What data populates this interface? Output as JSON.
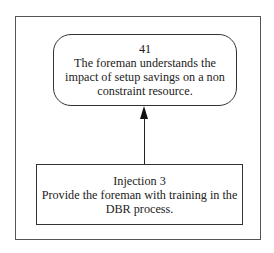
{
  "diagram": {
    "effect_node": {
      "id": "41",
      "lines": [
        "The foreman understands the",
        "impact of setup savings on a non",
        "constraint resource."
      ]
    },
    "injection_node": {
      "label": "Injection 3",
      "lines": [
        "Provide the foreman with training in the",
        "DBR process."
      ]
    },
    "edges": [
      {
        "from": "Injection 3",
        "to": "41",
        "type": "arrow"
      }
    ]
  }
}
